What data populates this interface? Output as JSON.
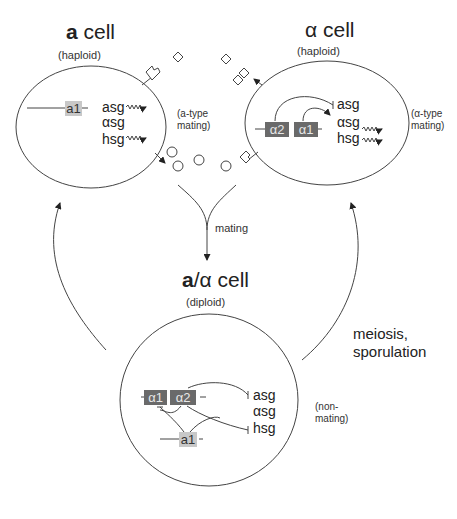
{
  "a_cell": {
    "title_bold": "a",
    "title_rest": " cell",
    "ploidy": "(haploid)",
    "locus": "a1",
    "genes": [
      "asg",
      "αsg",
      "hsg"
    ],
    "expressed": [
      "asg",
      "hsg"
    ],
    "phenotype_line1": "(a-type",
    "phenotype_line2": "mating)"
  },
  "alpha_cell": {
    "title": "α cell",
    "ploidy": "(haploid)",
    "loci": [
      "α2",
      "α1"
    ],
    "genes": [
      "asg",
      "αsg",
      "hsg"
    ],
    "expressed": [
      "αsg",
      "hsg"
    ],
    "repressed": [
      "asg"
    ],
    "phenotype_line1": "(α-type",
    "phenotype_line2": "mating)"
  },
  "diploid_cell": {
    "title_bold": "a",
    "title_rest": "/α cell",
    "ploidy": "(diploid)",
    "loci": [
      "α1",
      "α2",
      "a1"
    ],
    "genes": [
      "asg",
      "αsg",
      "hsg"
    ],
    "repressed": [
      "asg",
      "hsg",
      "α1"
    ],
    "phenotype_line1": "(non-",
    "phenotype_line2": "mating)"
  },
  "arrows": {
    "mating": "mating",
    "meiosis_line1": "meiosis,",
    "meiosis_line2": "sporulation"
  },
  "colors": {
    "light_box": "#c8c8c8",
    "dark_box": "#6a6a6a",
    "line": "#333333"
  }
}
